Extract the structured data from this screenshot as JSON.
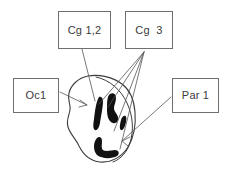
{
  "figure": {
    "background_color": "#ffffff",
    "width": 228,
    "height": 174,
    "line_color": "#555555",
    "box_border_color": "#6f6f6f",
    "text_color": "#3a3a3a",
    "blob_fill_color": "#111111"
  },
  "labels": {
    "cg12": {
      "text": "Cg 1,2",
      "box": {
        "x": 58,
        "y": 11,
        "width": 53,
        "height": 38
      }
    },
    "cg3": {
      "text": "Cg  3",
      "box": {
        "x": 125,
        "y": 11,
        "width": 48,
        "height": 38
      }
    },
    "oc1": {
      "text": "Oc1",
      "box": {
        "x": 13,
        "y": 78,
        "width": 46,
        "height": 35
      }
    },
    "par1": {
      "text": "Par 1",
      "box": {
        "x": 172,
        "y": 78,
        "width": 47,
        "height": 35
      }
    }
  },
  "leaders": {
    "cg12_leader": {
      "from": [
        82,
        49
      ],
      "to": [
        95,
        101
      ]
    },
    "cg3_leader_fan_apex": [
      144,
      52
    ],
    "cg3_leader_targets": [
      [
        99,
        104
      ],
      [
        108,
        107
      ],
      [
        114,
        130
      ],
      [
        120,
        148
      ]
    ],
    "oc1_leader": {
      "from": [
        60,
        92
      ],
      "to": [
        86,
        105
      ]
    },
    "par1_leader": {
      "from": [
        171,
        97
      ],
      "to": [
        123,
        140
      ]
    }
  },
  "section_outline": {
    "description": "irregular closed cortical section outline",
    "bounds": {
      "x": 66,
      "y": 75,
      "width": 70,
      "height": 88
    }
  },
  "inner_arc": {
    "description": "inner curved boundary along right side of section"
  },
  "marked_regions": [
    {
      "name": "blob-vertical-left",
      "description": "elongated vertical dark band"
    },
    {
      "name": "blob-comma-middle",
      "description": "thick comma shaped dark band"
    },
    {
      "name": "blob-oval-right",
      "description": "small elongated oval"
    },
    {
      "name": "blob-hook-bottom",
      "description": "L shaped hook dark band"
    }
  ]
}
